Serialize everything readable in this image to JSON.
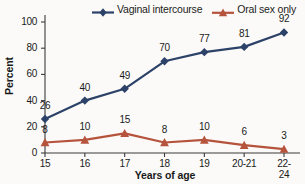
{
  "chart_data": {
    "type": "line",
    "title": "",
    "xlabel": "Years of age",
    "ylabel": "Percent",
    "categories": [
      "15",
      "16",
      "17",
      "18",
      "19",
      "20-21",
      "22-24"
    ],
    "yticks": [
      0,
      20,
      40,
      60,
      80,
      100
    ],
    "ylim": [
      0,
      100
    ],
    "grid": false,
    "legend_position": "top",
    "series": [
      {
        "name": "Vaginal intercourse",
        "color": "#2d4268",
        "marker": "diamond",
        "values": [
          26,
          40,
          49,
          70,
          77,
          81,
          92
        ]
      },
      {
        "name": "Oral sex only",
        "color": "#b5533c",
        "marker": "triangle",
        "values": [
          8,
          10,
          15,
          8,
          10,
          6,
          3
        ]
      }
    ]
  },
  "colors": {
    "series_1": "#2d4268",
    "series_2": "#b5533c",
    "axis": "#3b3b3b",
    "background": "#fbfaf8"
  }
}
